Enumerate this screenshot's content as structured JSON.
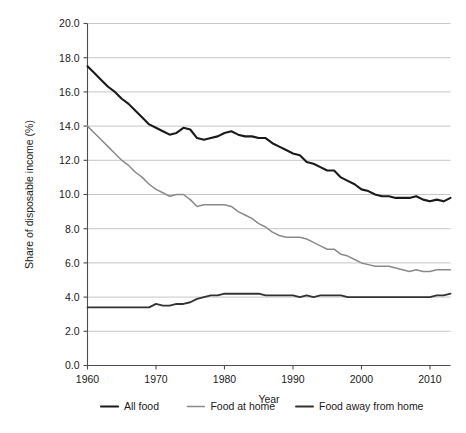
{
  "chart_data": {
    "type": "line",
    "title": "",
    "xlabel": "Year",
    "ylabel": "Share of disposable income (%)",
    "xlim": [
      1960,
      2013
    ],
    "ylim": [
      0.0,
      20.0
    ],
    "grid": true,
    "legend_position": "bottom",
    "xticks": [
      1960,
      1970,
      1980,
      1990,
      2000,
      2010
    ],
    "xtick_labels": [
      "1960",
      "1970",
      "1980",
      "1990",
      "2000",
      "2010"
    ],
    "yticks": [
      0.0,
      2.0,
      4.0,
      6.0,
      8.0,
      10.0,
      12.0,
      14.0,
      16.0,
      18.0,
      20.0
    ],
    "ytick_labels": [
      "0.0",
      "2.0",
      "4.0",
      "6.0",
      "8.0",
      "10.0",
      "12.0",
      "14.0",
      "16.0",
      "18.0",
      "20.0"
    ],
    "x": [
      1960,
      1961,
      1962,
      1963,
      1964,
      1965,
      1966,
      1967,
      1968,
      1969,
      1970,
      1971,
      1972,
      1973,
      1974,
      1975,
      1976,
      1977,
      1978,
      1979,
      1980,
      1981,
      1982,
      1983,
      1984,
      1985,
      1986,
      1987,
      1988,
      1989,
      1990,
      1991,
      1992,
      1993,
      1994,
      1995,
      1996,
      1997,
      1998,
      1999,
      2000,
      2001,
      2002,
      2003,
      2004,
      2005,
      2006,
      2007,
      2008,
      2009,
      2010,
      2011,
      2012,
      2013
    ],
    "series": [
      {
        "name": "All food",
        "color": "#1a1a1a",
        "width": 2.1,
        "values": [
          17.5,
          17.1,
          16.7,
          16.3,
          16.0,
          15.6,
          15.3,
          14.9,
          14.5,
          14.1,
          13.9,
          13.7,
          13.5,
          13.6,
          13.9,
          13.8,
          13.3,
          13.2,
          13.3,
          13.4,
          13.6,
          13.7,
          13.5,
          13.4,
          13.4,
          13.3,
          13.3,
          13.0,
          12.8,
          12.6,
          12.4,
          12.3,
          11.9,
          11.8,
          11.6,
          11.4,
          11.4,
          11.0,
          10.8,
          10.6,
          10.3,
          10.2,
          10.0,
          9.9,
          9.9,
          9.8,
          9.8,
          9.8,
          9.9,
          9.7,
          9.6,
          9.7,
          9.6,
          9.8
        ]
      },
      {
        "name": "Food at home",
        "color": "#8a8a8a",
        "width": 1.5,
        "values": [
          14.0,
          13.6,
          13.2,
          12.8,
          12.4,
          12.0,
          11.7,
          11.3,
          11.0,
          10.6,
          10.3,
          10.1,
          9.9,
          10.0,
          10.0,
          9.7,
          9.3,
          9.4,
          9.4,
          9.4,
          9.4,
          9.3,
          9.0,
          8.8,
          8.6,
          8.3,
          8.1,
          7.8,
          7.6,
          7.5,
          7.5,
          7.5,
          7.4,
          7.2,
          7.0,
          6.8,
          6.8,
          6.5,
          6.4,
          6.2,
          6.0,
          5.9,
          5.8,
          5.8,
          5.8,
          5.7,
          5.6,
          5.5,
          5.6,
          5.5,
          5.5,
          5.6,
          5.6,
          5.6
        ]
      },
      {
        "name": "Food away from home",
        "color": "#333333",
        "width": 1.9,
        "values": [
          3.4,
          3.4,
          3.4,
          3.4,
          3.4,
          3.4,
          3.4,
          3.4,
          3.4,
          3.4,
          3.6,
          3.5,
          3.5,
          3.6,
          3.6,
          3.7,
          3.9,
          4.0,
          4.1,
          4.1,
          4.2,
          4.2,
          4.2,
          4.2,
          4.2,
          4.2,
          4.1,
          4.1,
          4.1,
          4.1,
          4.1,
          4.0,
          4.1,
          4.0,
          4.1,
          4.1,
          4.1,
          4.1,
          4.0,
          4.0,
          4.0,
          4.0,
          4.0,
          4.0,
          4.0,
          4.0,
          4.0,
          4.0,
          4.0,
          4.0,
          4.0,
          4.1,
          4.1,
          4.2
        ]
      }
    ]
  },
  "legend": {
    "items": [
      {
        "label": "All food"
      },
      {
        "label": "Food at home"
      },
      {
        "label": "Food away from home"
      }
    ]
  }
}
